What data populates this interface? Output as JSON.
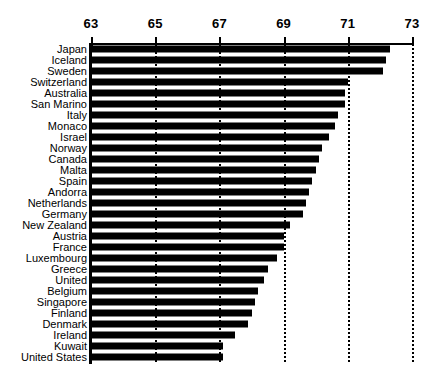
{
  "chart_data": {
    "type": "bar",
    "orientation": "horizontal",
    "title": "",
    "subtitle": "",
    "xlabel": "",
    "ylabel": "",
    "xlim": [
      63,
      73
    ],
    "xticks": [
      63,
      65,
      67,
      69,
      71,
      73
    ],
    "xtick_labels": [
      "63",
      "65",
      "67",
      "69",
      "71",
      "73"
    ],
    "grid": "vertical-dotted",
    "legend": "none",
    "bar_color": "#000000",
    "background_color": "#ffffff",
    "categories": [
      "Japan",
      "Iceland",
      "Sweden",
      "Switzerland",
      "Australia",
      "San Marino",
      "Italy",
      "Monaco",
      "Israel",
      "Norway",
      "Canada",
      "Malta",
      "Spain",
      "Andorra",
      "Netherlands",
      "Germany",
      "New Zealand",
      "Austria",
      "France",
      "Luxembourg",
      "Greece",
      "United",
      "Belgium",
      "Singapore",
      "Finland",
      "Denmark",
      "Ireland",
      "Kuwait",
      "United States"
    ],
    "values": [
      72.3,
      72.2,
      72.1,
      71.0,
      70.9,
      70.9,
      70.7,
      70.6,
      70.4,
      70.2,
      70.1,
      70.0,
      69.9,
      69.8,
      69.7,
      69.6,
      69.2,
      69.0,
      69.0,
      68.8,
      68.5,
      68.4,
      68.2,
      68.1,
      68.0,
      67.9,
      67.5,
      67.1,
      67.1
    ]
  }
}
